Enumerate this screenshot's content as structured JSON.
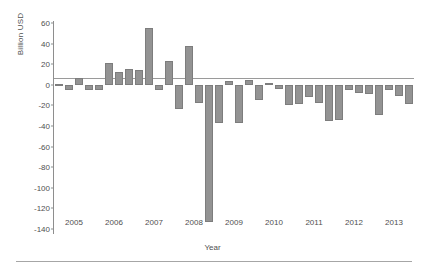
{
  "chart_data": {
    "type": "bar",
    "title": "",
    "subtitle": "",
    "xlabel": "Year",
    "ylabel": "Billion USD",
    "ylim": [
      -145,
      62
    ],
    "yticks": [
      60,
      40,
      20,
      0,
      -20,
      -40,
      -60,
      -80,
      -100,
      -120,
      -140
    ],
    "ytick_labels": [
      "60",
      "40",
      "20",
      "0",
      "-20",
      "-40",
      "-60",
      "-80",
      "-100",
      "-120",
      "-140"
    ],
    "xticks": [
      "2005",
      "2006",
      "2007",
      "2008",
      "2009",
      "2010",
      "2011",
      "2012",
      "2013"
    ],
    "grid": false,
    "legend": null,
    "bar_color": "#939393",
    "bar_edge_color": "#7d7d7d",
    "axis_color": "#8e8e8e",
    "text_color": "#4f4f4f",
    "background": "#ffffff",
    "categories": [
      "2005 Q1",
      "2005 Q2",
      "2005 Q3",
      "2005 Q4",
      "2006 Q1",
      "2006 Q2",
      "2006 Q3",
      "2006 Q4",
      "2007 Q1",
      "2007 Q2",
      "2007 Q3",
      "2007 Q4",
      "2008 Q1",
      "2008 Q2",
      "2008 Q3",
      "2008 Q4",
      "2009 Q1",
      "2009 Q2",
      "2009 Q3",
      "2009 Q4",
      "2010 Q1",
      "2010 Q2",
      "2010 Q3",
      "2010 Q4",
      "2011 Q1",
      "2011 Q2",
      "2011 Q3",
      "2011 Q4",
      "2012 Q1",
      "2012 Q2",
      "2012 Q3",
      "2012 Q4",
      "2013 Q1",
      "2013 Q2",
      "2013 Q3",
      "2013 Q4"
    ],
    "values": [
      1,
      -5,
      7,
      -5,
      -5,
      21,
      12,
      15,
      14,
      55,
      -5,
      23,
      -24,
      38,
      -18,
      -133,
      -37,
      4,
      -37,
      5,
      -15,
      2,
      -4,
      -20,
      -19,
      -12,
      -18,
      -35,
      -34,
      -5,
      -8,
      -9,
      -29,
      -5,
      -11,
      -19
    ],
    "series": [
      {
        "name": "Net flow",
        "values": [
          1,
          -5,
          7,
          -5,
          -5,
          21,
          12,
          15,
          14,
          55,
          -5,
          23,
          -24,
          38,
          -18,
          -133,
          -37,
          4,
          -37,
          5,
          -15,
          2,
          -4,
          -20,
          -19,
          -12,
          -18,
          -35,
          -34,
          -5,
          -8,
          -9,
          -29,
          -5,
          -11,
          -19
        ]
      }
    ]
  }
}
